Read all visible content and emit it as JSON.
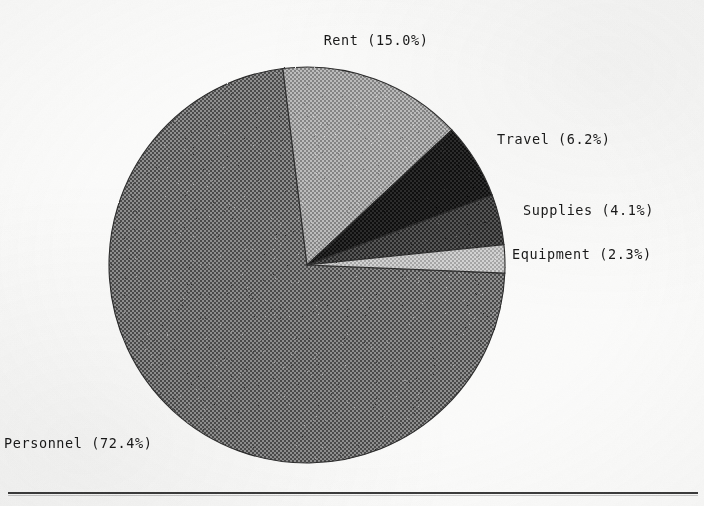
{
  "chart_data": {
    "type": "pie",
    "title": "",
    "subtitle": "",
    "xlabel": "",
    "ylabel": "",
    "legend_position": "none",
    "grid": false,
    "labels_show_percent": true,
    "start_angle_deg": 97,
    "direction": "clockwise",
    "categories": [
      "Rent",
      "Travel",
      "Supplies",
      "Equipment",
      "Personnel"
    ],
    "values": [
      15.0,
      6.2,
      4.1,
      2.3,
      72.4
    ],
    "units": "percent",
    "slices": [
      {
        "name": "Rent",
        "label": "Rent (15.0%)",
        "percent": 15.0,
        "percent_text": "15.0%",
        "fill": "#9d9d9d",
        "label_x": 376,
        "label_y": 32,
        "label_anchor": "middle"
      },
      {
        "name": "Travel",
        "label": "Travel (6.2%)",
        "percent": 6.2,
        "percent_text": "6.2%",
        "fill": "#1c1c1c",
        "label_x": 497,
        "label_y": 131,
        "label_anchor": "start"
      },
      {
        "name": "Supplies",
        "label": "Supplies (4.1%)",
        "percent": 4.1,
        "percent_text": "4.1%",
        "fill": "#3f3f3f",
        "label_x": 523,
        "label_y": 202,
        "label_anchor": "start"
      },
      {
        "name": "Equipment",
        "label": "Equipment (2.3%)",
        "percent": 2.3,
        "percent_text": "2.3%",
        "fill": "#b9b9b9",
        "label_x": 512,
        "label_y": 246,
        "label_anchor": "start"
      },
      {
        "name": "Personnel",
        "label": "Personnel (72.4%)",
        "percent": 72.4,
        "percent_text": "72.4%",
        "fill": "#737373",
        "label_x": 4,
        "label_y": 435,
        "label_anchor": "start"
      }
    ],
    "geometry": {
      "center_x": 307,
      "center_y": 265,
      "radius": 198
    }
  },
  "page": {
    "background_color": "#fbfbfa",
    "ink_color": "#1a1a1a",
    "rule_color": "#3a3a3a"
  }
}
